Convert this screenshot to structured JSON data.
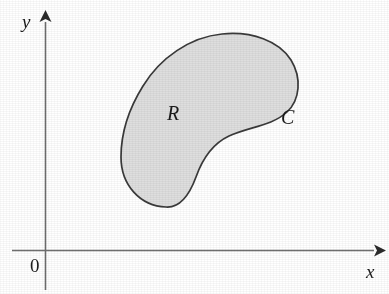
{
  "figure": {
    "type": "math-diagram",
    "background_color": "#ffffff"
  },
  "axes": {
    "x_axis": {
      "label": "x",
      "arrow": "right-arrowhead",
      "color": "#6f6f6f"
    },
    "y_axis": {
      "label": "y",
      "arrow": "up-arrowhead",
      "color": "#6f6f6f"
    },
    "origin": {
      "label": "0"
    }
  },
  "region": {
    "interior_label": "R",
    "boundary_label": "C",
    "fill_color": "#dedede",
    "stroke_color": "#3a3a3a"
  }
}
